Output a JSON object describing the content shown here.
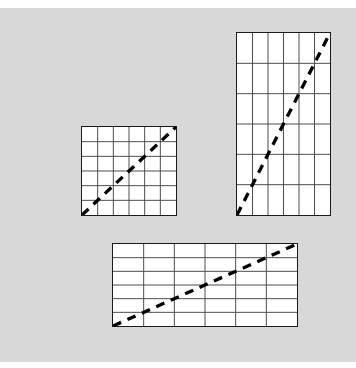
{
  "figure": {
    "title": "",
    "background_color": "#d8d8d8",
    "page_color": "#ffffff",
    "canvas": {
      "width": 356,
      "height": 368
    },
    "panel": {
      "x": 0,
      "y": 8,
      "width": 356,
      "height": 354
    }
  },
  "style": {
    "grid_fill": "#ffffff",
    "grid_line_color": "#4a4a4a",
    "border_color": "#1a1a1a",
    "trend_line_color": "#000000",
    "trend_line_dash": "9 7",
    "trend_line_width": 3.4,
    "grid_line_width": 1.0,
    "border_width": 1.6
  },
  "chart_data": {
    "type": "line",
    "title": "",
    "subtitle": "",
    "xlabel": "",
    "ylabel": "",
    "grid": true,
    "legend_position": "none",
    "annotations": [],
    "panels": [
      {
        "name": "square-grid",
        "label": "square",
        "x": 81,
        "y": 126,
        "width": 96,
        "height": 90,
        "rows": 6,
        "cols": 6,
        "aspect_ratio": 1.07,
        "series": [
          {
            "name": "diagonal",
            "style": "dashed",
            "x": [
              0,
              1
            ],
            "y": [
              0,
              1
            ],
            "slope": 1.0,
            "intercept": 0.0
          }
        ],
        "xlim": [
          0,
          6
        ],
        "ylim": [
          0,
          6
        ]
      },
      {
        "name": "tall-grid",
        "label": "portrait",
        "x": 236,
        "y": 32,
        "width": 95,
        "height": 184,
        "rows": 6,
        "cols": 6,
        "aspect_ratio": 0.52,
        "series": [
          {
            "name": "diagonal",
            "style": "dashed",
            "x": [
              0,
              1
            ],
            "y": [
              0,
              1
            ],
            "slope": 1.0,
            "intercept": 0.0
          }
        ],
        "xlim": [
          0,
          6
        ],
        "ylim": [
          0,
          6
        ]
      },
      {
        "name": "wide-grid",
        "label": "landscape",
        "x": 112,
        "y": 243,
        "width": 186,
        "height": 84,
        "rows": 6,
        "cols": 6,
        "aspect_ratio": 2.21,
        "series": [
          {
            "name": "diagonal",
            "style": "dashed",
            "x": [
              0,
              1
            ],
            "y": [
              0,
              1
            ],
            "slope": 1.0,
            "intercept": 0.0
          }
        ],
        "xlim": [
          0,
          6
        ],
        "ylim": [
          0,
          6
        ]
      }
    ]
  }
}
